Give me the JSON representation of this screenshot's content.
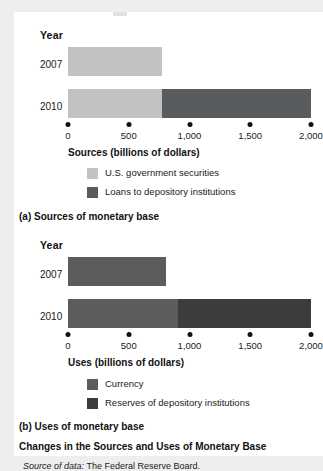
{
  "figure": {
    "title": "Changes in the Sources and Uses of Monetary Base",
    "source": "Source of data:",
    "source_value": "The Federal Reserve Board.",
    "colors": {
      "light_gray": "#c2c2c2",
      "dark_gray": "#585c5e",
      "mid_gray": "#5c5c5c",
      "darkest_gray": "#3c3c3c",
      "card_bg": "#ffffff",
      "page_bg": "#eeeeee",
      "text": "#111111"
    }
  },
  "panel_a": {
    "caption": "(a) Sources of monetary base",
    "year_header": "Year",
    "axis_title": "Sources (billions of dollars)",
    "tick_labels": [
      "0",
      "500",
      "1,000",
      "1,500",
      "2,000"
    ],
    "year_labels": [
      "2007",
      "2010"
    ],
    "legend": [
      {
        "label": "U.S. government securities",
        "color": "#c2c2c2"
      },
      {
        "label": "Loans to depository institutions",
        "color": "#585c5e"
      }
    ]
  },
  "panel_b": {
    "caption": "(b) Uses of monetary base",
    "year_header": "Year",
    "axis_title": "Uses (billions of dollars)",
    "tick_labels": [
      "0",
      "500",
      "1,000",
      "1,500",
      "2,000"
    ],
    "year_labels": [
      "2007",
      "2010"
    ],
    "legend": [
      {
        "label": "Currency",
        "color": "#5c5c5c"
      },
      {
        "label": "Reserves of depository institutions",
        "color": "#3c3c3c"
      }
    ]
  },
  "chart_data": [
    {
      "type": "bar",
      "orientation": "horizontal",
      "stacked": true,
      "title": "(a) Sources of monetary base",
      "xlabel": "Sources (billions of dollars)",
      "ylabel": "Year",
      "categories": [
        "2007",
        "2010"
      ],
      "xlim": [
        0,
        2000
      ],
      "xticks": [
        0,
        500,
        1000,
        1500,
        2000
      ],
      "grid": false,
      "legend_position": "below-axis",
      "series": [
        {
          "name": "U.S. government securities",
          "color": "#c2c2c2",
          "values": [
            775,
            775
          ]
        },
        {
          "name": "Loans to depository institutions",
          "color": "#585c5e",
          "values": [
            0,
            1225
          ]
        }
      ],
      "totals": [
        775,
        2000
      ]
    },
    {
      "type": "bar",
      "orientation": "horizontal",
      "stacked": true,
      "title": "(b) Uses of monetary base",
      "xlabel": "Uses (billions of dollars)",
      "ylabel": "Year",
      "categories": [
        "2007",
        "2010"
      ],
      "xlim": [
        0,
        2000
      ],
      "xticks": [
        0,
        500,
        1000,
        1500,
        2000
      ],
      "grid": false,
      "legend_position": "below-axis",
      "series": [
        {
          "name": "Currency",
          "color": "#5c5c5c",
          "values": [
            810,
            905
          ]
        },
        {
          "name": "Reserves of depository institutions",
          "color": "#3c3c3c",
          "values": [
            0,
            1095
          ]
        }
      ],
      "totals": [
        810,
        2000
      ]
    }
  ]
}
